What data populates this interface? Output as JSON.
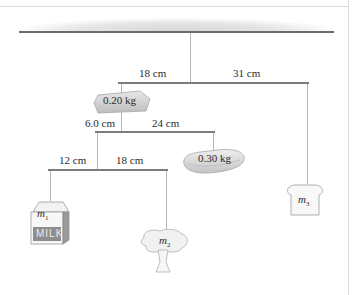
{
  "figure": {
    "type": "hanging-mobile",
    "top_rod": {
      "left_length": "18 cm",
      "right_length": "31 cm"
    },
    "middle_rod": {
      "left_length": "6.0 cm",
      "right_length": "24 cm"
    },
    "bottom_rod": {
      "left_length": "12 cm",
      "right_length": "18 cm"
    },
    "objects": {
      "block": {
        "label": "0.20 kg",
        "shape": "block-icon"
      },
      "steak": {
        "label": "0.30 kg",
        "shape": "steak-icon"
      },
      "milk": {
        "mass": "m",
        "subscript": "1",
        "text": "MILK",
        "shape": "milk-carton-icon"
      },
      "broccoli": {
        "mass": "m",
        "subscript": "2",
        "shape": "broccoli-icon"
      },
      "bread": {
        "mass": "m",
        "subscript": "3",
        "shape": "bread-slice-icon"
      }
    }
  }
}
